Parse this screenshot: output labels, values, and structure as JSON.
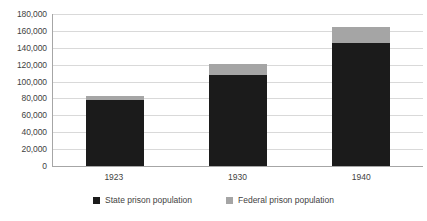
{
  "chart_data": {
    "type": "bar",
    "subtype": "stacked-column",
    "title": "",
    "subtitle": "",
    "xlabel": "",
    "ylabel": "",
    "categories": [
      "1923",
      "1930",
      "1940"
    ],
    "series": [
      {
        "name": "State prison population",
        "color": "#1b1b1b",
        "values": [
          78000,
          108000,
          146000
        ]
      },
      {
        "name": "Federal prison population",
        "color": "#a5a5a5",
        "values": [
          5000,
          13000,
          19000
        ]
      }
    ],
    "totals": [
      83000,
      121000,
      165000
    ],
    "ylim": [
      0,
      180000
    ],
    "ytick_step": 20000,
    "ytick_labels": [
      "180,000",
      "160,000",
      "140,000",
      "120,000",
      "100,000",
      "80,000",
      "60,000",
      "40,000",
      "20,000",
      "0"
    ],
    "ytick_values": [
      180000,
      160000,
      140000,
      120000,
      100000,
      80000,
      60000,
      40000,
      20000,
      0
    ],
    "grid": true,
    "grid_axis": "y",
    "legend_position": "bottom",
    "legend": [
      {
        "label": "State prison population",
        "color": "#1b1b1b"
      },
      {
        "label": "Federal prison population",
        "color": "#a5a5a5"
      }
    ]
  },
  "colors": {
    "state": "#1b1b1b",
    "federal": "#a5a5a5",
    "gridline": "#d9d9d9",
    "axis": "#a6a6a6",
    "text": "#3f3f3f",
    "background": "#ffffff"
  }
}
